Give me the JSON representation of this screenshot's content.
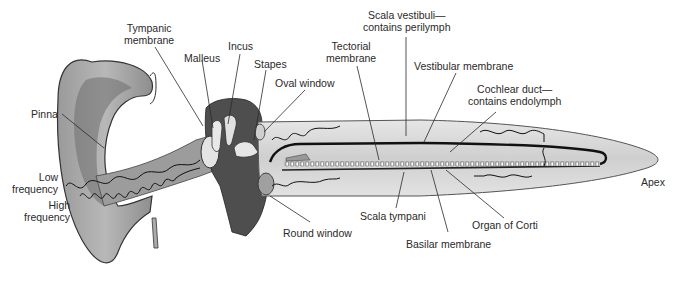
{
  "diagram": {
    "colors": {
      "background": "#ffffff",
      "tissue_light": "#d4d4d4",
      "tissue_mid": "#a6a6a6",
      "tissue_dark": "#4a4a4a",
      "membrane_line": "#111111",
      "label_text": "#2a2a2a"
    },
    "labels": {
      "tympanic_membrane": [
        "Tympanic",
        "membrane"
      ],
      "malleus": "Malleus",
      "incus": "Incus",
      "stapes": "Stapes",
      "oval_window": "Oval window",
      "pinna": "Pinna",
      "low_frequency": [
        "Low",
        "frequency"
      ],
      "high_frequency": [
        "High",
        "frequency"
      ],
      "round_window": "Round window",
      "tectorial_membrane": [
        "Tectorial",
        "membrane"
      ],
      "scala_vestibuli": [
        "Scala vestibuli—",
        "contains perilymph"
      ],
      "vestibular_membrane": "Vestibular membrane",
      "cochlear_duct": [
        "Cochlear duct—",
        "contains endolymph"
      ],
      "apex": "Apex",
      "scala_tympani": "Scala tympani",
      "organ_of_corti": "Organ of Corti",
      "basilar_membrane": "Basilar membrane"
    }
  }
}
